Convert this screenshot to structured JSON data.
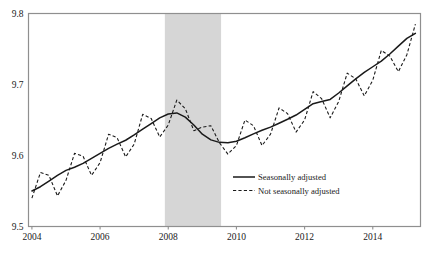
{
  "chart_data": {
    "type": "line",
    "title": "",
    "subtitle": "",
    "xlabel": "",
    "ylabel": "",
    "xlim": [
      2003.9,
      2015.4
    ],
    "ylim": [
      9.5,
      9.8
    ],
    "grid": false,
    "legend_position": "center-right-inside",
    "xticks": [
      "2004",
      "2006",
      "2008",
      "2010",
      "2012",
      "2014"
    ],
    "xtick_values": [
      2004,
      2006,
      2008,
      2010,
      2012,
      2014
    ],
    "yticks": [
      "9.5",
      "9.6",
      "9.7",
      "9.8"
    ],
    "ytick_values": [
      9.5,
      9.6,
      9.7,
      9.8
    ],
    "annotations": [
      {
        "name": "recession-shading",
        "type": "vertical-band",
        "x_start": 2007.9,
        "x_end": 2009.55,
        "color": "#d6d6d6",
        "label": ""
      }
    ],
    "x": [
      2004.0,
      2004.25,
      2004.5,
      2004.75,
      2005.0,
      2005.25,
      2005.5,
      2005.75,
      2006.0,
      2006.25,
      2006.5,
      2006.75,
      2007.0,
      2007.25,
      2007.5,
      2007.75,
      2008.0,
      2008.25,
      2008.5,
      2008.75,
      2009.0,
      2009.25,
      2009.5,
      2009.75,
      2010.0,
      2010.25,
      2010.5,
      2010.75,
      2011.0,
      2011.25,
      2011.5,
      2011.75,
      2012.0,
      2012.25,
      2012.5,
      2012.75,
      2013.0,
      2013.25,
      2013.5,
      2013.75,
      2014.0,
      2014.25,
      2014.5,
      2014.75,
      2015.0,
      2015.25
    ],
    "series": [
      {
        "name": "Seasonally adjusted",
        "style": "solid",
        "color": "#1a1a1a",
        "values": [
          9.55,
          9.556,
          9.564,
          9.572,
          9.579,
          9.5835,
          9.589,
          9.596,
          9.603,
          9.61,
          9.616,
          9.6215,
          9.629,
          9.637,
          9.645,
          9.653,
          9.6585,
          9.66,
          9.654,
          9.643,
          9.63,
          9.622,
          9.6185,
          9.618,
          9.62,
          9.625,
          9.6305,
          9.6355,
          9.64,
          9.6455,
          9.651,
          9.657,
          9.665,
          9.673,
          9.676,
          9.679,
          9.688,
          9.698,
          9.708,
          9.717,
          9.725,
          9.733,
          9.743,
          9.754,
          9.765,
          9.772
        ]
      },
      {
        "name": "Not seasonally adjusted",
        "style": "dashed",
        "color": "#1a1a1a",
        "values": [
          9.54,
          9.576,
          9.572,
          9.543,
          9.565,
          9.603,
          9.599,
          9.572,
          9.59,
          9.63,
          9.625,
          9.598,
          9.616,
          9.658,
          9.652,
          9.626,
          9.643,
          9.678,
          9.666,
          9.635,
          9.64,
          9.642,
          9.618,
          9.602,
          9.614,
          9.65,
          9.642,
          9.614,
          9.63,
          9.667,
          9.659,
          9.633,
          9.65,
          9.69,
          9.68,
          9.653,
          9.676,
          9.716,
          9.708,
          9.684,
          9.706,
          9.748,
          9.74,
          9.718,
          9.742,
          9.785
        ]
      }
    ],
    "legend": [
      {
        "label": "Seasonally adjusted",
        "style": "solid"
      },
      {
        "label": "Not seasonally adjusted",
        "style": "dashed"
      }
    ]
  }
}
